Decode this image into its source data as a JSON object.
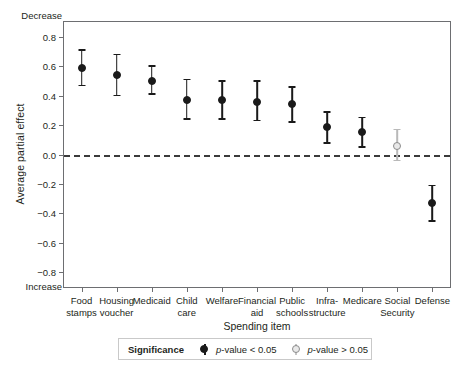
{
  "chart_data": {
    "type": "scatter",
    "title": "",
    "xlabel": "Spending item",
    "ylabel": "Average partial effect",
    "ylim": [
      -0.9,
      0.9
    ],
    "yticks": [
      0.8,
      0.6,
      0.4,
      0.2,
      0.0,
      -0.2,
      -0.4,
      -0.6,
      -0.8
    ],
    "ytick_labels": [
      "0.8",
      "0.6",
      "0.4",
      "0.2",
      "0.0",
      "-0.2",
      "-0.4",
      "-0.6",
      "-0.8"
    ],
    "grid": false,
    "zero_reference_line": 0.0,
    "axis_direction_top_note": "Decrease",
    "axis_direction_bottom_note": "Increase",
    "categories": [
      "Food stamps",
      "Housing voucher",
      "Medicaid",
      "Child care",
      "Welfare",
      "Financial aid",
      "Public schools",
      "Infra-structure",
      "Medicare",
      "Social Security",
      "Defense"
    ],
    "category_lines": [
      [
        "Food",
        "stamps"
      ],
      [
        "Housing",
        "voucher"
      ],
      [
        "Medicaid",
        ""
      ],
      [
        "Child",
        "care"
      ],
      [
        "Welfare",
        ""
      ],
      [
        "Financial",
        "aid"
      ],
      [
        "Public",
        "schools"
      ],
      [
        "Infra-",
        "structure"
      ],
      [
        "Medicare",
        ""
      ],
      [
        "Social",
        "Security"
      ],
      [
        "Defense",
        ""
      ]
    ],
    "points": [
      {
        "category": "Food stamps",
        "value": 0.59,
        "low": 0.47,
        "high": 0.71,
        "significant": true
      },
      {
        "category": "Housing voucher",
        "value": 0.54,
        "low": 0.4,
        "high": 0.68,
        "significant": true
      },
      {
        "category": "Medicaid",
        "value": 0.5,
        "low": 0.41,
        "high": 0.6,
        "significant": true
      },
      {
        "category": "Child care",
        "value": 0.37,
        "low": 0.24,
        "high": 0.51,
        "significant": true
      },
      {
        "category": "Welfare",
        "value": 0.37,
        "low": 0.24,
        "high": 0.5,
        "significant": true
      },
      {
        "category": "Financial aid",
        "value": 0.36,
        "low": 0.23,
        "high": 0.5,
        "significant": true
      },
      {
        "category": "Public schools",
        "value": 0.34,
        "low": 0.22,
        "high": 0.46,
        "significant": true
      },
      {
        "category": "Infra-structure",
        "value": 0.19,
        "low": 0.08,
        "high": 0.29,
        "significant": true
      },
      {
        "category": "Medicare",
        "value": 0.15,
        "low": 0.05,
        "high": 0.25,
        "significant": true
      },
      {
        "category": "Social Security",
        "value": 0.06,
        "low": -0.04,
        "high": 0.17,
        "significant": false
      },
      {
        "category": "Defense",
        "value": -0.33,
        "low": -0.45,
        "high": -0.21,
        "significant": true
      }
    ],
    "legend": {
      "position": "bottom",
      "title": "Significance",
      "entries": [
        {
          "label": "p-value < 0.05",
          "marker": "filled-circle",
          "color": "#1a1a1a"
        },
        {
          "label": "p-value > 0.05",
          "marker": "open-circle",
          "color": "#8c8c8c"
        }
      ]
    }
  }
}
